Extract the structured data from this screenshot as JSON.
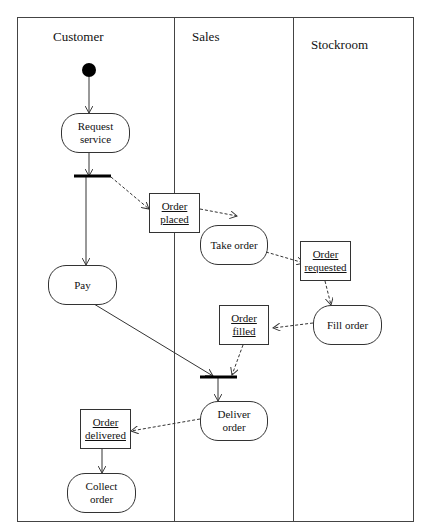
{
  "diagram": {
    "type": "UML activity diagram with swimlanes",
    "swimlanes": [
      {
        "id": "customer",
        "label": "Customer"
      },
      {
        "id": "sales",
        "label": "Sales"
      },
      {
        "id": "stockroom",
        "label": "Stockroom"
      }
    ],
    "nodes": {
      "initial": {
        "kind": "initial"
      },
      "request_service": {
        "kind": "activity",
        "line1": "Request",
        "line2": "service",
        "lane": "customer"
      },
      "fork": {
        "kind": "fork"
      },
      "order_placed": {
        "kind": "object",
        "line1": "Order",
        "line2": "placed",
        "lane": "sales"
      },
      "take_order": {
        "kind": "activity",
        "line1": "Take order",
        "lane": "sales"
      },
      "pay": {
        "kind": "activity",
        "line1": "Pay",
        "lane": "customer"
      },
      "order_requested": {
        "kind": "object",
        "line1": "Order",
        "line2": "requested",
        "lane": "stockroom"
      },
      "fill_order": {
        "kind": "activity",
        "line1": "Fill order",
        "lane": "stockroom"
      },
      "order_filled": {
        "kind": "object",
        "line1": "Order",
        "line2": "filled",
        "lane": "sales"
      },
      "join": {
        "kind": "join"
      },
      "deliver_order": {
        "kind": "activity",
        "line1": "Deliver",
        "line2": "order",
        "lane": "sales"
      },
      "order_delivered": {
        "kind": "object",
        "line1": "Order",
        "line2": "delivered",
        "lane": "customer"
      },
      "collect_order": {
        "kind": "activity",
        "line1": "Collect",
        "line2": "order",
        "lane": "customer"
      }
    },
    "edges": [
      {
        "from": "initial",
        "to": "request_service",
        "style": "solid"
      },
      {
        "from": "request_service",
        "to": "fork",
        "style": "solid"
      },
      {
        "from": "fork",
        "to": "order_placed",
        "style": "dashed"
      },
      {
        "from": "fork",
        "to": "pay",
        "style": "solid"
      },
      {
        "from": "order_placed",
        "to": "take_order",
        "style": "dashed"
      },
      {
        "from": "take_order",
        "to": "order_requested",
        "style": "dashed"
      },
      {
        "from": "order_requested",
        "to": "fill_order",
        "style": "dashed"
      },
      {
        "from": "fill_order",
        "to": "order_filled",
        "style": "dashed"
      },
      {
        "from": "order_filled",
        "to": "join",
        "style": "dashed"
      },
      {
        "from": "pay",
        "to": "join",
        "style": "solid"
      },
      {
        "from": "join",
        "to": "deliver_order",
        "style": "solid"
      },
      {
        "from": "deliver_order",
        "to": "order_delivered",
        "style": "dashed"
      },
      {
        "from": "order_delivered",
        "to": "collect_order",
        "style": "solid"
      }
    ],
    "colors": {
      "line": "#333333",
      "bar": "#000000",
      "background": "#ffffff"
    }
  }
}
